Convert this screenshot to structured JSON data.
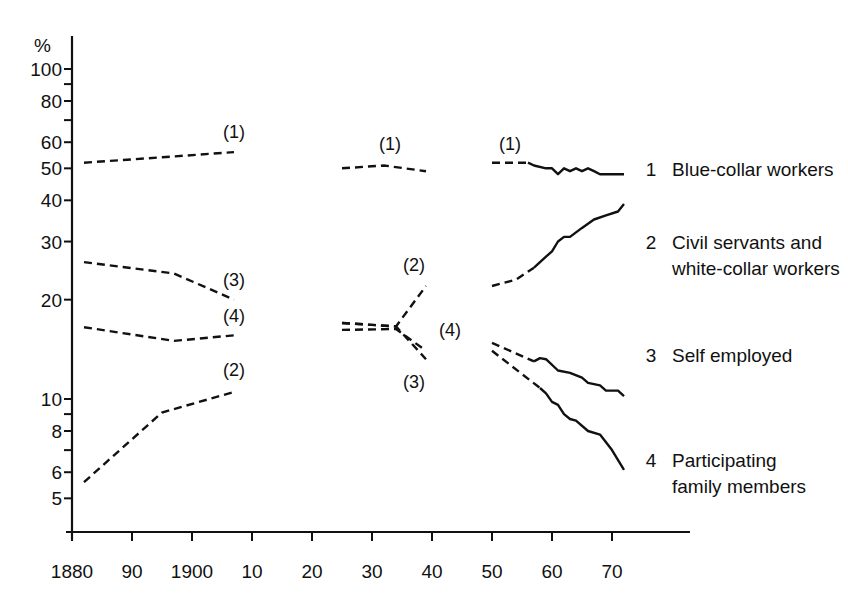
{
  "chart_data": {
    "type": "line",
    "title": "",
    "xlabel": "",
    "ylabel": "%",
    "yscale": "log",
    "ylim": [
      4.3,
      110
    ],
    "xlim": [
      1880,
      1979
    ],
    "grid": false,
    "legend_position": "right, inline labels",
    "x_ticks": [
      {
        "value": 1880,
        "label": "1880"
      },
      {
        "value": 1890,
        "label": "90"
      },
      {
        "value": 1900,
        "label": "1900"
      },
      {
        "value": 1910,
        "label": "10"
      },
      {
        "value": 1920,
        "label": "20"
      },
      {
        "value": 1930,
        "label": "30"
      },
      {
        "value": 1940,
        "label": "40"
      },
      {
        "value": 1950,
        "label": "50"
      },
      {
        "value": 1960,
        "label": "60"
      },
      {
        "value": 1970,
        "label": "70"
      }
    ],
    "y_ticks": [
      {
        "value": 100,
        "label": "100"
      },
      {
        "value": 90,
        "label": ""
      },
      {
        "value": 80,
        "label": "80"
      },
      {
        "value": 70,
        "label": ""
      },
      {
        "value": 60,
        "label": "60"
      },
      {
        "value": 50,
        "label": "50"
      },
      {
        "value": 40,
        "label": "40"
      },
      {
        "value": 30,
        "label": "30"
      },
      {
        "value": 20,
        "label": "20"
      },
      {
        "value": 10,
        "label": "10"
      },
      {
        "value": 9,
        "label": ""
      },
      {
        "value": 8,
        "label": "8"
      },
      {
        "value": 7,
        "label": ""
      },
      {
        "value": 6,
        "label": "6"
      },
      {
        "value": 5,
        "label": "5"
      }
    ],
    "series": [
      {
        "id": 1,
        "name": "Blue-collar workers",
        "annotation": "(1)",
        "segments": [
          {
            "style": "dashed",
            "points": [
              [
                1882,
                52
              ],
              [
                1895,
                54
              ],
              [
                1907,
                56
              ]
            ]
          },
          {
            "style": "dashed",
            "points": [
              [
                1925,
                50
              ],
              [
                1932,
                51
              ],
              [
                1939,
                49
              ]
            ]
          },
          {
            "style": "dashed",
            "points": [
              [
                1950,
                52
              ],
              [
                1956,
                52
              ]
            ]
          },
          {
            "style": "solid",
            "points": [
              [
                1956,
                52
              ],
              [
                1957,
                51
              ],
              [
                1959,
                50
              ],
              [
                1960,
                50
              ],
              [
                1961,
                48
              ],
              [
                1962,
                50
              ],
              [
                1963,
                49
              ],
              [
                1964,
                50
              ],
              [
                1965,
                49
              ],
              [
                1966,
                50
              ],
              [
                1967,
                49
              ],
              [
                1968,
                48
              ],
              [
                1970,
                48
              ],
              [
                1972,
                48
              ]
            ]
          }
        ]
      },
      {
        "id": 2,
        "name": "Civil servants and white-collar workers",
        "annotation": "(2)",
        "segments": [
          {
            "style": "dashed",
            "points": [
              [
                1882,
                5.6
              ],
              [
                1895,
                9.1
              ],
              [
                1907,
                10.5
              ]
            ]
          },
          {
            "style": "dashed",
            "points": [
              [
                1925,
                17
              ],
              [
                1934,
                16.6
              ],
              [
                1939,
                22
              ]
            ]
          },
          {
            "style": "dashed",
            "points": [
              [
                1950,
                22
              ],
              [
                1954,
                23
              ],
              [
                1957,
                25
              ]
            ]
          },
          {
            "style": "solid",
            "points": [
              [
                1957,
                25
              ],
              [
                1959,
                27
              ],
              [
                1960,
                28
              ],
              [
                1961,
                30
              ],
              [
                1962,
                31
              ],
              [
                1963,
                31
              ],
              [
                1965,
                33
              ],
              [
                1967,
                35
              ],
              [
                1969,
                36
              ],
              [
                1971,
                37
              ],
              [
                1972,
                39
              ]
            ]
          }
        ]
      },
      {
        "id": 3,
        "name": "Self employed",
        "annotation": "(3)",
        "segments": [
          {
            "style": "dashed",
            "points": [
              [
                1882,
                26
              ],
              [
                1897,
                24
              ],
              [
                1907,
                20
              ]
            ]
          },
          {
            "style": "dashed",
            "points": [
              [
                1925,
                17
              ],
              [
                1934,
                16.6
              ],
              [
                1939,
                13.2
              ]
            ]
          },
          {
            "style": "dashed",
            "points": [
              [
                1950,
                14.8
              ],
              [
                1957,
                13
              ]
            ]
          },
          {
            "style": "solid",
            "points": [
              [
                1957,
                13
              ],
              [
                1958,
                13.3
              ],
              [
                1959,
                13.2
              ],
              [
                1961,
                12.2
              ],
              [
                1963,
                12
              ],
              [
                1965,
                11.6
              ],
              [
                1966,
                11.2
              ],
              [
                1968,
                11
              ],
              [
                1969,
                10.6
              ],
              [
                1971,
                10.6
              ],
              [
                1972,
                10.2
              ]
            ]
          }
        ]
      },
      {
        "id": 4,
        "name": "Participating family members",
        "annotation": "(4)",
        "segments": [
          {
            "style": "dashed",
            "points": [
              [
                1882,
                16.5
              ],
              [
                1897,
                15
              ],
              [
                1907,
                15.6
              ]
            ]
          },
          {
            "style": "dashed",
            "points": [
              [
                1925,
                16.2
              ],
              [
                1934,
                16.3
              ],
              [
                1939,
                14
              ]
            ]
          },
          {
            "style": "dashed",
            "points": [
              [
                1950,
                14
              ],
              [
                1958,
                10.8
              ]
            ]
          },
          {
            "style": "solid",
            "points": [
              [
                1958,
                10.8
              ],
              [
                1959,
                10.4
              ],
              [
                1960,
                9.8
              ],
              [
                1961,
                9.6
              ],
              [
                1962,
                9
              ],
              [
                1963,
                8.7
              ],
              [
                1964,
                8.6
              ],
              [
                1966,
                8
              ],
              [
                1968,
                7.8
              ],
              [
                1970,
                7
              ],
              [
                1972,
                6.1
              ]
            ]
          }
        ]
      }
    ],
    "annotations": [
      {
        "text": "(1)",
        "x": 1907,
        "y": 62
      },
      {
        "text": "(3)",
        "x": 1907,
        "y": 22
      },
      {
        "text": "(4)",
        "x": 1907,
        "y": 17.1
      },
      {
        "text": "(2)",
        "x": 1907,
        "y": 11.7
      },
      {
        "text": "(1)",
        "x": 1933,
        "y": 57
      },
      {
        "text": "(2)",
        "x": 1937,
        "y": 24.5
      },
      {
        "text": "(4)",
        "x": 1943,
        "y": 15.5
      },
      {
        "text": "(3)",
        "x": 1937,
        "y": 10.8
      },
      {
        "text": "(1)",
        "x": 1953,
        "y": 57
      }
    ]
  },
  "axes": {
    "y_unit_label": "%"
  },
  "legend": [
    {
      "number": "1",
      "lines": [
        "Blue-collar workers"
      ]
    },
    {
      "number": "2",
      "lines": [
        "Civil servants and",
        "white-collar workers"
      ]
    },
    {
      "number": "3",
      "lines": [
        "Self employed"
      ]
    },
    {
      "number": "4",
      "lines": [
        "Participating",
        "family members"
      ]
    }
  ]
}
